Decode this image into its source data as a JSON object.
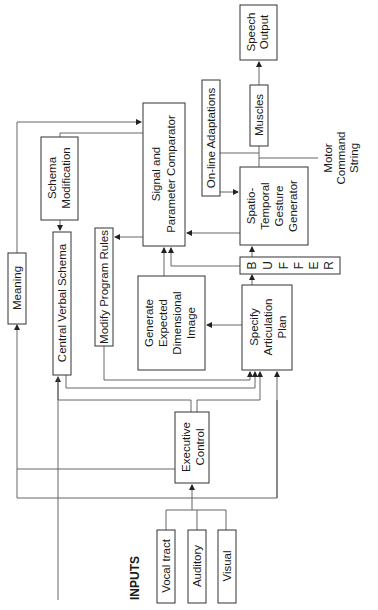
{
  "diagram": {
    "orientation": "rotated 90 degrees counter-clockwise",
    "stroke_color": "#333333",
    "background": "#ffffff",
    "nodes": {
      "speech_output": {
        "lines": [
          "Speech",
          "Output"
        ]
      },
      "muscles": {
        "lines": [
          "Muscles"
        ]
      },
      "online_adaptations": {
        "lines": [
          "On-line Adaptations"
        ]
      },
      "motor_command_string": {
        "lines": [
          "Motor",
          "Command",
          "String"
        ]
      },
      "signal_comparator": {
        "lines": [
          "Signal and",
          "Parameter Comparator"
        ]
      },
      "gesture_generator": {
        "lines": [
          "Spatio-",
          "Temporal",
          "Gesture",
          "Generator"
        ]
      },
      "schema_modification": {
        "lines": [
          "Schema",
          "Modification"
        ]
      },
      "buffer": {
        "letters": [
          "B",
          "U",
          "F",
          "F",
          "E",
          "R"
        ]
      },
      "meaning": {
        "lines": [
          "Meaning"
        ]
      },
      "central_verbal_schema": {
        "lines": [
          "Central Verbal Schema"
        ]
      },
      "modify_program_rules": {
        "lines": [
          "Modify Program Rules"
        ]
      },
      "expected_image": {
        "lines": [
          "Generate",
          "Expected",
          "Dimensional",
          "Image"
        ]
      },
      "articulation_plan": {
        "lines": [
          "Specify",
          "Articulation",
          "Plan"
        ]
      },
      "executive_control": {
        "lines": [
          "Executive",
          "Control"
        ]
      },
      "inputs_label": {
        "lines": [
          "INPUTS"
        ]
      },
      "vocal_tract": {
        "lines": [
          "Vocal tract"
        ]
      },
      "auditory": {
        "lines": [
          "Auditory"
        ]
      },
      "visual": {
        "lines": [
          "Visual"
        ]
      }
    },
    "edges": [
      {
        "from": "Inputs (Vocal tract, Auditory, Visual)",
        "to": "Executive Control"
      },
      {
        "from": "Executive Control",
        "to": "Central Verbal Schema"
      },
      {
        "from": "Executive Control",
        "to": "Specify Articulation Plan"
      },
      {
        "from": "Executive Control",
        "to": "Signal and Parameter Comparator"
      },
      {
        "from": "Inputs",
        "to": "Meaning"
      },
      {
        "from": "Inputs",
        "to": "Central Verbal Schema"
      },
      {
        "from": "Inputs",
        "to": "Specify Articulation Plan"
      },
      {
        "from": "Central Verbal Schema",
        "to": "Specify Articulation Plan"
      },
      {
        "from": "Modify Program Rules",
        "to": "Specify Articulation Plan"
      },
      {
        "from": "Schema Modification",
        "to": "Central Verbal Schema"
      },
      {
        "from": "Signal and Parameter Comparator",
        "to": "Schema Modification"
      },
      {
        "from": "Signal and Parameter Comparator",
        "to": "Modify Program Rules"
      },
      {
        "from": "Specify Articulation Plan",
        "to": "Generate Expected Dimensional Image"
      },
      {
        "from": "Specify Articulation Plan",
        "to": "BUFFER"
      },
      {
        "from": "Generate Expected Dimensional Image",
        "to": "Signal and Parameter Comparator"
      },
      {
        "from": "BUFFER",
        "to": "Signal and Parameter Comparator"
      },
      {
        "from": "BUFFER",
        "to": "Spatio-Temporal Gesture Generator"
      },
      {
        "from": "Spatio-Temporal Gesture Generator",
        "to": "Signal and Parameter Comparator"
      },
      {
        "from": "On-line Adaptations",
        "to": "Spatio-Temporal Gesture Generator"
      },
      {
        "from": "Spatio-Temporal Gesture Generator",
        "to": "Muscles"
      },
      {
        "from": "Muscles",
        "to": "Speech Output"
      },
      {
        "from": "Meaning",
        "to": "Signal and Parameter Comparator"
      }
    ]
  }
}
